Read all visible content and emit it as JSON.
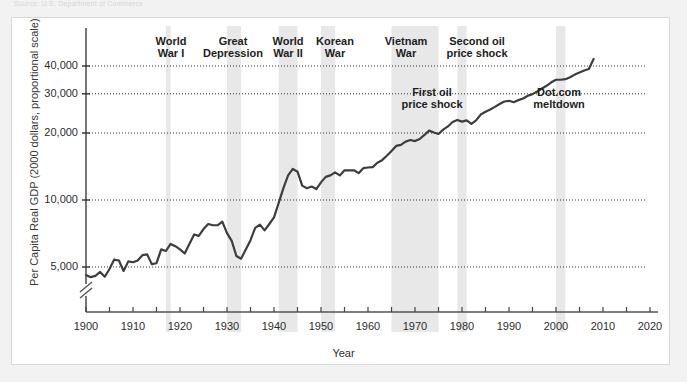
{
  "faint_header": "Source: U.S. Department of Commerce",
  "chart_data": {
    "type": "line",
    "title": "",
    "xlabel": "Year",
    "ylabel": "Per Capita Real GDP (2000 dollars, proportional scale)",
    "yscale": "log",
    "xlim": [
      1900,
      2020
    ],
    "ylim": [
      4000,
      50000
    ],
    "grid": "horizontal-dotted",
    "legend": "none",
    "axis_break": true,
    "yticks": [
      {
        "value": 5000,
        "label": "5,000"
      },
      {
        "value": 10000,
        "label": "10,000"
      },
      {
        "value": 20000,
        "label": "20,000"
      },
      {
        "value": 30000,
        "label": "30,000"
      },
      {
        "value": 40000,
        "label": "40,000"
      }
    ],
    "xticks": [
      {
        "value": 1900,
        "label": "1900"
      },
      {
        "value": 1910,
        "label": "1910"
      },
      {
        "value": 1920,
        "label": "1920"
      },
      {
        "value": 1930,
        "label": "1930"
      },
      {
        "value": 1940,
        "label": "1940"
      },
      {
        "value": 1950,
        "label": "1950"
      },
      {
        "value": 1960,
        "label": "1960"
      },
      {
        "value": 1970,
        "label": "1970"
      },
      {
        "value": 1980,
        "label": "1980"
      },
      {
        "value": 1990,
        "label": "1990"
      },
      {
        "value": 2000,
        "label": "2000"
      },
      {
        "value": 2010,
        "label": "2010"
      },
      {
        "value": 2020,
        "label": "2020"
      }
    ],
    "xtick_minor_step": 5,
    "series": [
      {
        "name": "Per Capita Real GDP",
        "color": "#3d3d3d",
        "x": [
          1900,
          1901,
          1902,
          1903,
          1904,
          1905,
          1906,
          1907,
          1908,
          1909,
          1910,
          1911,
          1912,
          1913,
          1914,
          1915,
          1916,
          1917,
          1918,
          1919,
          1920,
          1921,
          1922,
          1923,
          1924,
          1925,
          1926,
          1927,
          1928,
          1929,
          1930,
          1931,
          1932,
          1933,
          1934,
          1935,
          1936,
          1937,
          1938,
          1939,
          1940,
          1941,
          1942,
          1943,
          1944,
          1945,
          1946,
          1947,
          1948,
          1949,
          1950,
          1951,
          1952,
          1953,
          1954,
          1955,
          1956,
          1957,
          1958,
          1959,
          1960,
          1961,
          1962,
          1963,
          1964,
          1965,
          1966,
          1967,
          1968,
          1969,
          1970,
          1971,
          1972,
          1973,
          1974,
          1975,
          1976,
          1977,
          1978,
          1979,
          1980,
          1981,
          1982,
          1983,
          1984,
          1985,
          1986,
          1987,
          1988,
          1989,
          1990,
          1991,
          1992,
          1993,
          1994,
          1995,
          1996,
          1997,
          1998,
          1999,
          2000,
          2001,
          2002,
          2003,
          2004,
          2005,
          2006,
          2007,
          2008
        ],
        "y": [
          4600,
          4500,
          4560,
          4750,
          4520,
          4900,
          5400,
          5350,
          4800,
          5300,
          5250,
          5350,
          5650,
          5700,
          5150,
          5200,
          6000,
          5900,
          6350,
          6200,
          6000,
          5750,
          6350,
          7000,
          6900,
          7400,
          7800,
          7700,
          7700,
          8000,
          7100,
          6550,
          5600,
          5450,
          6000,
          6600,
          7500,
          7750,
          7300,
          7800,
          8350,
          9700,
          11300,
          12900,
          13800,
          13400,
          11600,
          11300,
          11500,
          11200,
          12000,
          12700,
          12900,
          13300,
          12900,
          13600,
          13600,
          13600,
          13200,
          13900,
          14000,
          14050,
          14700,
          15100,
          15800,
          16600,
          17500,
          17700,
          18300,
          18600,
          18400,
          18800,
          19600,
          20500,
          20100,
          19800,
          20700,
          21400,
          22400,
          22900,
          22500,
          22800,
          22000,
          22800,
          24200,
          24900,
          25500,
          26200,
          27000,
          27700,
          27900,
          27500,
          28100,
          28600,
          29400,
          29900,
          30700,
          31700,
          32600,
          33800,
          34700,
          34700,
          34900,
          35600,
          36600,
          37400,
          38200,
          38800,
          43000
        ]
      }
    ],
    "shaded_bands": [
      {
        "name": "World War I",
        "start": 1917,
        "end": 1918,
        "label": "World\nWar I",
        "label_x": 171,
        "label_y": 35
      },
      {
        "name": "Great Depression",
        "start": 1930,
        "end": 1933,
        "label": "Great\nDepression",
        "label_x": 233,
        "label_y": 35
      },
      {
        "name": "World War II",
        "start": 1941,
        "end": 1945,
        "label": "World\nWar II",
        "label_x": 288,
        "label_y": 35
      },
      {
        "name": "Korean War",
        "start": 1950,
        "end": 1953,
        "label": "Korean\nWar",
        "label_x": 335,
        "label_y": 35
      },
      {
        "name": "Vietnam War",
        "start": 1965,
        "end": 1973,
        "label": "Vietnam\nWar",
        "label_x": 406,
        "label_y": 35
      },
      {
        "name": "First oil price shock",
        "start": 1973,
        "end": 1975,
        "label": "First oil\nprice shock",
        "label_x": 432,
        "label_y": 86
      },
      {
        "name": "Second oil price shock",
        "start": 1979,
        "end": 1981,
        "label": "Second oil\nprice shock",
        "label_x": 477,
        "label_y": 35
      },
      {
        "name": "Dot.com meltdown",
        "start": 2000,
        "end": 2002,
        "label": "Dot.com\nmeltdown",
        "label_x": 559,
        "label_y": 86
      }
    ],
    "band_color": "#e8e8e8",
    "gridline_color": "#333333"
  }
}
